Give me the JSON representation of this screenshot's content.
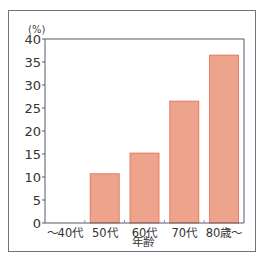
{
  "chart_data": {
    "type": "bar",
    "title": "",
    "unit_label": "(%)",
    "xlabel": "年齢",
    "ylabel": "",
    "categories": [
      "〜40代",
      "50代",
      "60代",
      "70代",
      "80歳〜"
    ],
    "values": [
      0,
      10.7,
      15.2,
      26.5,
      36.5
    ],
    "ylim": [
      0,
      40
    ],
    "yticks": [
      0,
      5,
      10,
      15,
      20,
      25,
      30,
      35,
      40
    ],
    "grid": false,
    "legend": "none",
    "colors": {
      "bar_fill": "#eea48c",
      "bar_stroke": "#e06a52",
      "axis": "#555a63",
      "frame": "#6f7480"
    }
  }
}
